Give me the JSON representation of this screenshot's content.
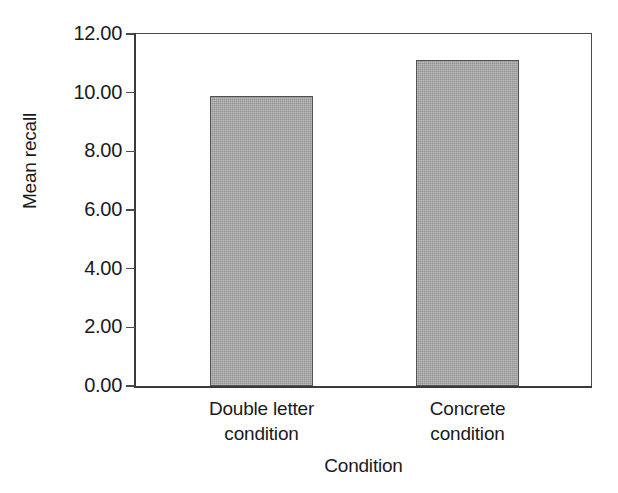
{
  "chart_data": {
    "type": "bar",
    "title": "",
    "subtitle": "",
    "categories": [
      "Double letter condition",
      "Concrete condition"
    ],
    "category_lines": [
      [
        "Double letter",
        "condition"
      ],
      [
        "Concrete",
        "condition"
      ]
    ],
    "values": [
      9.9,
      11.1
    ],
    "xlabel": "Condition",
    "ylabel": "Mean recall",
    "ylim": [
      0.0,
      12.0
    ],
    "ytick_values": [
      0.0,
      2.0,
      4.0,
      6.0,
      8.0,
      10.0,
      12.0
    ],
    "ytick_labels": [
      "0.00",
      "2.00",
      "4.00",
      "6.00",
      "8.00",
      "10.00",
      "12.00"
    ],
    "xtick_labels": [
      "Double letter condition",
      "Concrete condition"
    ],
    "grid": false,
    "legend": null,
    "legend_position": "none",
    "bar_fill_color": "#a2a2a2",
    "bar_border_color": "#535353",
    "axis_color": "#3a3a3a",
    "background_color": "#ffffff",
    "text_color": "#1a1a1a",
    "annotations": []
  },
  "figure": {
    "y_axis_title": "Mean recall",
    "x_axis_title": "Condition",
    "ticks": [
      {
        "label": "12.00",
        "value": 12.0
      },
      {
        "label": "10.00",
        "value": 10.0
      },
      {
        "label": "8.00",
        "value": 8.0
      },
      {
        "label": "6.00",
        "value": 6.0
      },
      {
        "label": "4.00",
        "value": 4.0
      },
      {
        "label": "2.00",
        "value": 2.0
      },
      {
        "label": "0.00",
        "value": 0.0
      }
    ],
    "bars": [
      {
        "line1": "Double letter",
        "line2": "condition",
        "value": 9.9
      },
      {
        "line1": "Concrete",
        "line2": "condition",
        "value": 11.1
      }
    ]
  }
}
